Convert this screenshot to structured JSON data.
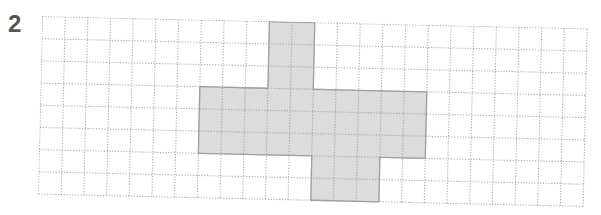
{
  "problem": {
    "number": "2"
  },
  "grid": {
    "columns": 24,
    "rows": 8,
    "cell_width": 22.7,
    "cell_height": 22.2,
    "line_color": "#9a9a9a",
    "fill_color": "#dcdcdc",
    "outline_color": "#a0a0a0"
  },
  "shape": {
    "description": "Shaded polyomino on dotted grid",
    "shaded_cells_by_row": [
      {
        "row": 0,
        "cols": [
          10,
          11
        ]
      },
      {
        "row": 1,
        "cols": [
          10,
          11
        ]
      },
      {
        "row": 2,
        "cols": [
          10,
          11
        ]
      },
      {
        "row": 3,
        "cols": [
          7,
          8,
          9,
          10,
          11,
          12,
          13,
          14,
          15,
          16
        ]
      },
      {
        "row": 4,
        "cols": [
          7,
          8,
          9,
          10,
          11,
          12,
          13,
          14,
          15,
          16
        ]
      },
      {
        "row": 5,
        "cols": [
          7,
          8,
          9,
          10,
          11,
          12,
          13,
          14,
          15,
          16
        ]
      },
      {
        "row": 6,
        "cols": [
          12,
          13,
          14
        ]
      },
      {
        "row": 7,
        "cols": [
          12,
          13,
          14
        ]
      }
    ],
    "total_shaded_cells": 42
  }
}
